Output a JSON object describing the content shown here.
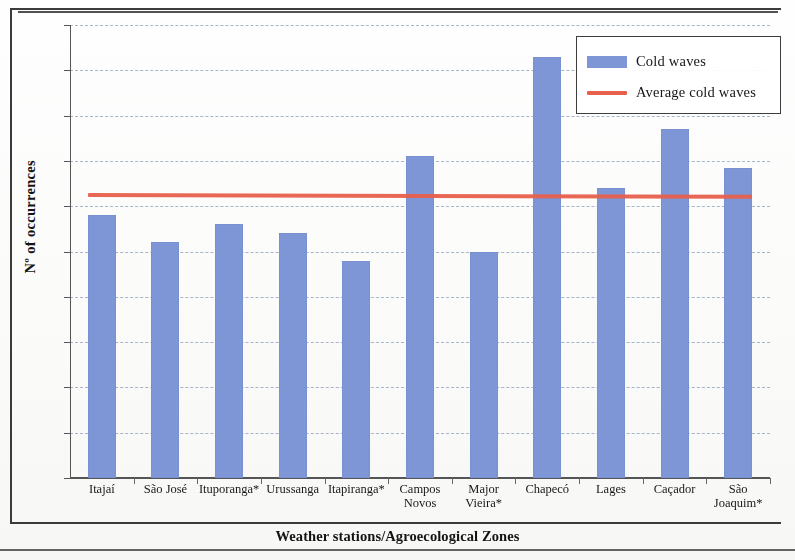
{
  "chart_data": {
    "type": "bar",
    "title": "",
    "xlabel": "Weather stations/Agroecological Zones",
    "ylabel": "Nº of occurrences",
    "ylim": [
      0,
      100
    ],
    "ytick_step": 10,
    "yticks": [
      "100",
      "90",
      "80",
      "70",
      "60",
      "50",
      "40",
      "30",
      "20",
      "10",
      "0"
    ],
    "grid": true,
    "legend_position": "top-right",
    "categories": [
      "Itajaí",
      "São José",
      "Ituporanga*",
      "Urussanga",
      "Itapiranga*",
      "Campos\nNovos",
      "Major\nVieira*",
      "Chapecó",
      "Lages",
      "Caçador",
      "São\nJoaquim*"
    ],
    "series": [
      {
        "name": "Cold waves",
        "type": "bar",
        "color": "#7e96d6",
        "values": [
          58,
          52,
          56,
          54,
          48,
          71,
          50,
          93,
          64,
          77,
          68.5
        ]
      },
      {
        "name": "Average cold waves",
        "type": "line",
        "color": "#e8604c",
        "values": [
          63,
          63,
          63,
          63,
          63,
          62.8,
          62.8,
          62.7,
          62.7,
          62.6,
          62.6
        ]
      }
    ]
  },
  "legend": {
    "entries": [
      {
        "label": "Cold waves",
        "marker": "bar-swatch",
        "color": "#7e96d6"
      },
      {
        "label": "Average cold waves",
        "marker": "line-swatch",
        "color": "#e8604c"
      }
    ]
  },
  "axes": {
    "y_title": "Nº of occurrences",
    "x_title": "Weather stations/Agroecological Zones"
  }
}
